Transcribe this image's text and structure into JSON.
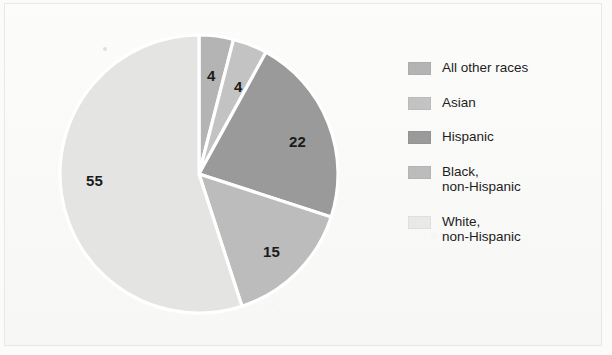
{
  "figure": {
    "background_color": "#fbfbfa",
    "frame_border_color": "#e8e8e6"
  },
  "chart_data": {
    "type": "pie",
    "title": "",
    "subtitle": "",
    "xlabel": "",
    "ylabel": "",
    "units": "percent",
    "grid": false,
    "legend_position": "right",
    "start_angle_deg": 0,
    "direction": "clockwise",
    "slice_separator_color": "#ffffff",
    "categories": [
      "All other races",
      "Asian",
      "Hispanic",
      "Black, non-Hispanic",
      "White, non-Hispanic"
    ],
    "values": [
      4,
      4,
      22,
      15,
      55
    ],
    "labels": [
      "4",
      "4",
      "22",
      "15",
      "55"
    ],
    "colors": [
      "#b4b4b4",
      "#c3c3c3",
      "#9a9a9a",
      "#bcbcbc",
      "#e4e4e3"
    ],
    "slices": [
      {
        "name": "All other races",
        "value": 4,
        "label": "4",
        "color": "#b4b4b4",
        "start_deg": 0,
        "end_deg": 14.4,
        "label_x": 207,
        "label_y": 67
      },
      {
        "name": "Asian",
        "value": 4,
        "label": "4",
        "color": "#c3c3c3",
        "start_deg": 14.4,
        "end_deg": 28.8,
        "label_x": 234,
        "label_y": 78
      },
      {
        "name": "Hispanic",
        "value": 22,
        "label": "22",
        "color": "#9a9a9a",
        "start_deg": 28.8,
        "end_deg": 108.0,
        "label_x": 289,
        "label_y": 133
      },
      {
        "name": "Black, non-Hispanic",
        "value": 15,
        "label": "15",
        "color": "#bcbcbc",
        "start_deg": 108.0,
        "end_deg": 162.0,
        "label_x": 263,
        "label_y": 243
      },
      {
        "name": "White, non-Hispanic",
        "value": 55,
        "label": "55",
        "color": "#e4e4e3",
        "start_deg": 162.0,
        "end_deg": 360.0,
        "label_x": 86,
        "label_y": 172
      }
    ]
  },
  "legend": {
    "items": [
      {
        "label": "All other races",
        "color": "#b4b4b4"
      },
      {
        "label": "Asian",
        "color": "#c3c3c3"
      },
      {
        "label": "Hispanic",
        "color": "#9a9a9a"
      },
      {
        "label": "Black,\nnon-Hispanic",
        "color": "#bcbcbc"
      },
      {
        "label": "White,\nnon-Hispanic",
        "color": "#e9e9e8"
      }
    ]
  }
}
